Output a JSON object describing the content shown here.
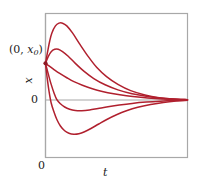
{
  "figure": {
    "background_color": "#ffffff",
    "frame_color": "#a8a8a8",
    "curve_color": "#b0202e",
    "text_color": "#1a1a1a"
  },
  "labels": {
    "initial_point_open": "(0, ",
    "initial_point_var": "x",
    "initial_point_sub": "0",
    "initial_point_close": ")",
    "y_axis": "x",
    "y_zero": "0",
    "t_zero": "0",
    "x_axis": "t"
  },
  "chart_data": {
    "type": "line",
    "title": "",
    "xlabel": "t",
    "ylabel": "x",
    "grid": false,
    "legend": null,
    "xlim": [
      0,
      1
    ],
    "ylim": [
      -1,
      1
    ],
    "annotations": [
      {
        "text": "(0, x0)",
        "x": 0,
        "y": 0.47,
        "marker": true
      }
    ],
    "x_ticks": [
      {
        "value": 0,
        "label": "0"
      }
    ],
    "y_ticks": [
      {
        "value": 0,
        "label": "0"
      }
    ],
    "series": [
      {
        "name": "curve-1-large-overshoot",
        "comment": "rises to large positive peak then decays to 0",
        "points": [
          [
            0.0,
            0.47
          ],
          [
            0.015,
            0.62
          ],
          [
            0.03,
            0.76
          ],
          [
            0.045,
            0.86
          ],
          [
            0.07,
            0.95
          ],
          [
            0.095,
            0.985
          ],
          [
            0.12,
            0.985
          ],
          [
            0.15,
            0.95
          ],
          [
            0.19,
            0.86
          ],
          [
            0.24,
            0.72
          ],
          [
            0.3,
            0.56
          ],
          [
            0.36,
            0.42
          ],
          [
            0.43,
            0.3
          ],
          [
            0.51,
            0.2
          ],
          [
            0.6,
            0.12
          ],
          [
            0.7,
            0.065
          ],
          [
            0.8,
            0.03
          ],
          [
            0.9,
            0.012
          ],
          [
            1.0,
            0.004
          ]
        ]
      },
      {
        "name": "curve-2-small-overshoot",
        "comment": "small rise above x0 then decays to 0",
        "points": [
          [
            0.0,
            0.47
          ],
          [
            0.02,
            0.56
          ],
          [
            0.04,
            0.62
          ],
          [
            0.065,
            0.65
          ],
          [
            0.09,
            0.65
          ],
          [
            0.12,
            0.62
          ],
          [
            0.16,
            0.56
          ],
          [
            0.21,
            0.47
          ],
          [
            0.27,
            0.37
          ],
          [
            0.34,
            0.275
          ],
          [
            0.42,
            0.195
          ],
          [
            0.51,
            0.13
          ],
          [
            0.61,
            0.08
          ],
          [
            0.72,
            0.045
          ],
          [
            0.83,
            0.022
          ],
          [
            0.92,
            0.01
          ],
          [
            1.0,
            0.004
          ]
        ]
      },
      {
        "name": "curve-3-critically-damped",
        "comment": "monotonic decay from x0 to 0, no overshoot",
        "points": [
          [
            0.0,
            0.47
          ],
          [
            0.03,
            0.43
          ],
          [
            0.06,
            0.39
          ],
          [
            0.1,
            0.34
          ],
          [
            0.15,
            0.285
          ],
          [
            0.2,
            0.235
          ],
          [
            0.26,
            0.19
          ],
          [
            0.33,
            0.145
          ],
          [
            0.4,
            0.11
          ],
          [
            0.48,
            0.08
          ],
          [
            0.57,
            0.055
          ],
          [
            0.67,
            0.035
          ],
          [
            0.77,
            0.02
          ],
          [
            0.87,
            0.01
          ],
          [
            1.0,
            0.003
          ]
        ]
      },
      {
        "name": "curve-4-small-undershoot",
        "comment": "falls through zero to a shallow negative minimum then returns to 0",
        "points": [
          [
            0.0,
            0.47
          ],
          [
            0.02,
            0.33
          ],
          [
            0.04,
            0.2
          ],
          [
            0.06,
            0.09
          ],
          [
            0.08,
            0.005
          ],
          [
            0.105,
            -0.075
          ],
          [
            0.135,
            -0.14
          ],
          [
            0.17,
            -0.185
          ],
          [
            0.21,
            -0.21
          ],
          [
            0.255,
            -0.215
          ],
          [
            0.31,
            -0.2
          ],
          [
            0.37,
            -0.17
          ],
          [
            0.44,
            -0.135
          ],
          [
            0.52,
            -0.1
          ],
          [
            0.61,
            -0.068
          ],
          [
            0.71,
            -0.042
          ],
          [
            0.81,
            -0.023
          ],
          [
            0.91,
            -0.01
          ],
          [
            1.0,
            -0.003
          ]
        ]
      },
      {
        "name": "curve-5-large-undershoot",
        "comment": "falls steeply through zero to a deep negative minimum then returns to 0",
        "points": [
          [
            0.0,
            0.47
          ],
          [
            0.012,
            0.28
          ],
          [
            0.025,
            0.11
          ],
          [
            0.04,
            -0.06
          ],
          [
            0.06,
            -0.24
          ],
          [
            0.08,
            -0.39
          ],
          [
            0.105,
            -0.52
          ],
          [
            0.135,
            -0.615
          ],
          [
            0.165,
            -0.665
          ],
          [
            0.2,
            -0.685
          ],
          [
            0.235,
            -0.675
          ],
          [
            0.275,
            -0.635
          ],
          [
            0.32,
            -0.57
          ],
          [
            0.375,
            -0.48
          ],
          [
            0.435,
            -0.385
          ],
          [
            0.5,
            -0.295
          ],
          [
            0.57,
            -0.215
          ],
          [
            0.65,
            -0.145
          ],
          [
            0.74,
            -0.09
          ],
          [
            0.83,
            -0.048
          ],
          [
            0.92,
            -0.02
          ],
          [
            1.0,
            -0.005
          ]
        ]
      }
    ]
  }
}
